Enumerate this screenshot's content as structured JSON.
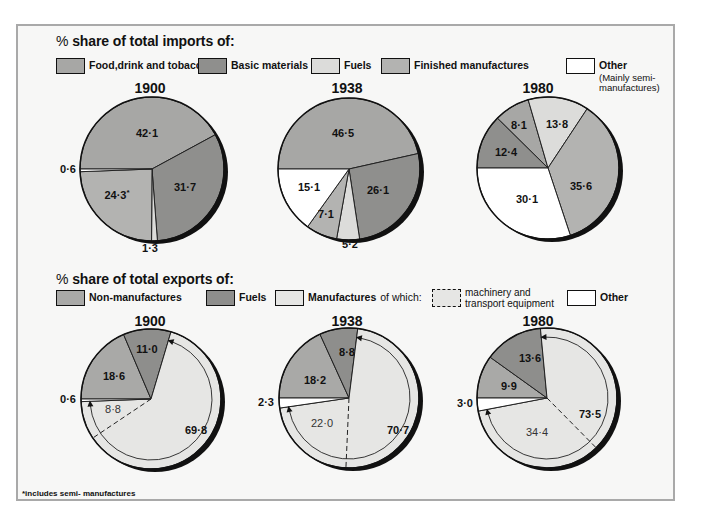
{
  "colors": {
    "food": "#a7a7a5",
    "basic": "#8f8f8d",
    "fuels_import": "#dcdcda",
    "finished": "#b3b3b1",
    "other": "#ffffff",
    "non_manufactures": "#a9a9a7",
    "fuels_export": "#8e8e8c",
    "manufactures": "#e6e6e4",
    "frame_bg": "#f7f7f6",
    "frame_border": "#a9a9a9"
  },
  "imports": {
    "title_pct": "%",
    "title": "share of total imports of:",
    "legend": [
      {
        "key": "food",
        "label": "Food,drink and tobacco"
      },
      {
        "key": "basic",
        "label": "Basic materials"
      },
      {
        "key": "fuels",
        "label": "Fuels"
      },
      {
        "key": "finished",
        "label": "Finished manufactures"
      },
      {
        "key": "other",
        "label": "Other",
        "sublabel": "(Mainly semi-manufactures)",
        "sub1": "(Mainly semi-",
        "sub2": "manufactures)"
      }
    ],
    "years": [
      "1900",
      "1938",
      "1980"
    ]
  },
  "exports": {
    "title_pct": "%",
    "title": "share of total exports of:",
    "legend": [
      {
        "key": "non_manufactures",
        "label": "Non-manufactures"
      },
      {
        "key": "fuels",
        "label": "Fuels"
      },
      {
        "key": "manufactures",
        "label": "Manufactures",
        "suffix": "of which:"
      },
      {
        "key": "machinery",
        "label": "machinery and transport equipment",
        "line1": "machinery and",
        "line2": "transport equipment"
      },
      {
        "key": "other",
        "label": "Other"
      }
    ],
    "years": [
      "1900",
      "1938",
      "1980"
    ]
  },
  "footnote": "*includes semi- manufactures",
  "chart_data": [
    {
      "type": "pie",
      "title": "% share of total imports of: 1900",
      "categories": [
        "Food,drink and tobacco",
        "Basic materials",
        "Fuels",
        "Finished manufactures",
        "Other"
      ],
      "values": [
        42.1,
        31.7,
        1.3,
        24.3,
        0.6
      ],
      "labels": [
        "42·1",
        "31·7",
        "1·3",
        "24·3*",
        "0·6"
      ],
      "annotations": [
        "* includes semi-manufactures"
      ]
    },
    {
      "type": "pie",
      "title": "% share of total imports of: 1938",
      "categories": [
        "Food,drink and tobacco",
        "Basic materials",
        "Fuels",
        "Finished manufactures",
        "Other"
      ],
      "values": [
        46.5,
        26.1,
        5.2,
        7.1,
        15.1
      ],
      "labels": [
        "46·5",
        "26·1",
        "5·2",
        "7·1",
        "15·1"
      ]
    },
    {
      "type": "pie",
      "title": "% share of total imports of: 1980",
      "categories": [
        "Food,drink and tobacco",
        "Basic materials",
        "Fuels",
        "Finished manufactures",
        "Other"
      ],
      "values": [
        8.1,
        12.4,
        13.8,
        35.6,
        30.1
      ],
      "labels": [
        "8·1",
        "12·4",
        "13·8",
        "35·6",
        "30·1"
      ]
    },
    {
      "type": "pie",
      "title": "% share of total exports of: 1900",
      "categories": [
        "Non-manufactures",
        "Fuels",
        "Manufactures",
        "Other"
      ],
      "values": [
        18.6,
        11.0,
        69.8,
        0.6
      ],
      "labels": [
        "18·6",
        "11·0",
        "69·8",
        "0·6"
      ],
      "sub_segment": {
        "name": "machinery and transport equipment",
        "parent": "Manufactures",
        "value": 8.8,
        "label": "8·8"
      }
    },
    {
      "type": "pie",
      "title": "% share of total exports of: 1938",
      "categories": [
        "Non-manufactures",
        "Fuels",
        "Manufactures",
        "Other"
      ],
      "values": [
        18.2,
        8.8,
        70.7,
        2.3
      ],
      "labels": [
        "18·2",
        "8·8",
        "70·7",
        "2·3"
      ],
      "sub_segment": {
        "name": "machinery and transport equipment",
        "parent": "Manufactures",
        "value": 22.0,
        "label": "22·0"
      }
    },
    {
      "type": "pie",
      "title": "% share of total exports of: 1980",
      "categories": [
        "Non-manufactures",
        "Fuels",
        "Manufactures",
        "Other"
      ],
      "values": [
        9.9,
        13.6,
        73.5,
        3.0
      ],
      "labels": [
        "9·9",
        "13·6",
        "73·5",
        "3·0"
      ],
      "sub_segment": {
        "name": "machinery and transport equipment",
        "parent": "Manufactures",
        "value": 34.4,
        "label": "34·4"
      }
    }
  ],
  "pies": {
    "imports": [
      {
        "year": "1900",
        "cx": 152,
        "cy": 169,
        "r": 72,
        "slices": [
          {
            "key": "food",
            "value": 42.1,
            "label": "42·1",
            "lx": 147,
            "ly": 137
          },
          {
            "key": "basic",
            "value": 31.7,
            "label": "31·7",
            "lx": 185,
            "ly": 191
          },
          {
            "key": "fuels_import",
            "value": 1.3,
            "label": "1·3",
            "lx": 150,
            "ly": 252,
            "outside": true
          },
          {
            "key": "finished",
            "value": 24.3,
            "label": "24·3*",
            "lx": 117,
            "ly": 199
          },
          {
            "key": "other",
            "value": 0.6,
            "label": "0·6",
            "lx": 68,
            "ly": 173,
            "outside": true
          }
        ]
      },
      {
        "year": "1938",
        "cx": 349,
        "cy": 169,
        "r": 71,
        "slices": [
          {
            "key": "food",
            "value": 46.5,
            "label": "46·5",
            "lx": 343,
            "ly": 137
          },
          {
            "key": "basic",
            "value": 26.1,
            "label": "26·1",
            "lx": 378,
            "ly": 194
          },
          {
            "key": "fuels_import",
            "value": 5.2,
            "label": "5·2",
            "lx": 350,
            "ly": 248,
            "outside": true
          },
          {
            "key": "finished",
            "value": 7.1,
            "label": "7·1",
            "lx": 326,
            "ly": 218
          },
          {
            "key": "other",
            "value": 15.1,
            "label": "15·1",
            "lx": 309,
            "ly": 191
          }
        ]
      },
      {
        "year": "1980",
        "cx": 548,
        "cy": 168,
        "r": 71,
        "slices": [
          {
            "key": "basic",
            "value": 12.4,
            "label": "12·4",
            "lx": 506,
            "ly": 156
          },
          {
            "key": "food",
            "value": 8.1,
            "label": "8·1",
            "lx": 519,
            "ly": 129
          },
          {
            "key": "fuels_import",
            "value": 13.8,
            "label": "13·8",
            "lx": 557,
            "ly": 128
          },
          {
            "key": "finished",
            "value": 35.6,
            "label": "35·6",
            "lx": 581,
            "ly": 190
          },
          {
            "key": "other",
            "value": 30.1,
            "label": "30·1",
            "lx": 527,
            "ly": 203
          }
        ]
      }
    ],
    "exports": [
      {
        "year": "1900",
        "cx": 151,
        "cy": 399,
        "r": 70,
        "slices": [
          {
            "key": "non_manufactures",
            "value": 18.6,
            "label": "18·6",
            "lx": 114,
            "ly": 380
          },
          {
            "key": "fuels_export",
            "value": 11.0,
            "label": "11·0",
            "lx": 147,
            "ly": 353
          },
          {
            "key": "manufactures",
            "value": 69.8,
            "label": "69·8",
            "lx": 196,
            "ly": 434
          },
          {
            "key": "other",
            "value": 0.6,
            "label": "0·6",
            "lx": 68,
            "ly": 403,
            "outside": true
          }
        ],
        "machinery": {
          "value": 8.8,
          "label": "8·8",
          "lx": 113,
          "ly": 413
        }
      },
      {
        "year": "1938",
        "cx": 349,
        "cy": 398,
        "r": 70,
        "slices": [
          {
            "key": "non_manufactures",
            "value": 18.2,
            "label": "18·2",
            "lx": 315,
            "ly": 384
          },
          {
            "key": "fuels_export",
            "value": 8.8,
            "label": "8·8",
            "lx": 347,
            "ly": 356
          },
          {
            "key": "manufactures",
            "value": 70.7,
            "label": "70·7",
            "lx": 398,
            "ly": 434
          },
          {
            "key": "other",
            "value": 2.3,
            "label": "2·3",
            "lx": 266,
            "ly": 406,
            "outside": true
          }
        ],
        "machinery": {
          "value": 22.0,
          "label": "22·0",
          "lx": 322,
          "ly": 427
        }
      },
      {
        "year": "1980",
        "cx": 547,
        "cy": 398,
        "r": 70,
        "slices": [
          {
            "key": "non_manufactures",
            "value": 9.9,
            "label": "9·9",
            "lx": 509,
            "ly": 390
          },
          {
            "key": "fuels_export",
            "value": 13.6,
            "label": "13·6",
            "lx": 530,
            "ly": 362
          },
          {
            "key": "manufactures",
            "value": 73.5,
            "label": "73·5",
            "lx": 590,
            "ly": 418
          },
          {
            "key": "other",
            "value": 3.0,
            "label": "3·0",
            "lx": 465,
            "ly": 407,
            "outside": true
          }
        ],
        "machinery": {
          "value": 34.4,
          "label": "34·4",
          "lx": 537,
          "ly": 436
        }
      }
    ]
  }
}
